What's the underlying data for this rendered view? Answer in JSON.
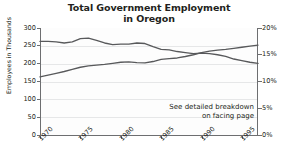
{
  "chart_data": {
    "type": "line",
    "title": "Total Government Employment in Oregon",
    "title_line1": "Total Government Employment",
    "title_line2": "in Oregon",
    "xlabel": "",
    "ylabel": "Employees in Thousands",
    "y2label": "Percentage of Total Employment",
    "ylim": [
      0,
      300
    ],
    "y2lim": [
      0,
      20
    ],
    "xlim": [
      1970,
      1997
    ],
    "grid": true,
    "legend": "none",
    "yticks": [
      "0",
      "50",
      "100",
      "150",
      "200",
      "250",
      "300"
    ],
    "ytick_values": [
      0,
      50,
      100,
      150,
      200,
      250,
      300
    ],
    "y2ticks": [
      "0%",
      "5%",
      "10%",
      "15%",
      "20%"
    ],
    "y2tick_values": [
      0,
      5,
      10,
      15,
      20
    ],
    "xticks": [
      "1970",
      "1975",
      "1980",
      "1985",
      "1990",
      "1995"
    ],
    "xtick_values": [
      1970,
      1975,
      1980,
      1985,
      1990,
      1995
    ],
    "x": [
      1970,
      1971,
      1972,
      1973,
      1974,
      1975,
      1976,
      1977,
      1978,
      1979,
      1980,
      1981,
      1982,
      1983,
      1984,
      1985,
      1986,
      1987,
      1988,
      1989,
      1990,
      1991,
      1992,
      1993,
      1994,
      1995,
      1996,
      1997
    ],
    "series": [
      {
        "name": "Percentage of Total Employment",
        "axis": "right",
        "units": "percent",
        "color": "#58595b",
        "values": [
          17.5,
          17.5,
          17.4,
          17.2,
          17.4,
          18.0,
          18.1,
          17.7,
          17.2,
          16.9,
          17.0,
          17.0,
          17.2,
          17.1,
          16.5,
          16.0,
          15.9,
          15.6,
          15.4,
          15.2,
          15.3,
          15.2,
          15.0,
          14.7,
          14.2,
          13.9,
          13.6,
          13.4
        ]
      },
      {
        "name": "Employees in Thousands",
        "axis": "left",
        "units": "thousands",
        "color": "#58595b",
        "values": [
          163,
          168,
          173,
          178,
          184,
          190,
          194,
          196,
          198,
          201,
          204,
          205,
          203,
          202,
          206,
          212,
          214,
          216,
          220,
          225,
          231,
          235,
          238,
          240,
          243,
          246,
          249,
          252
        ]
      }
    ],
    "annotations": [
      {
        "name": "see-detailed-breakdown",
        "line1": "See detailed breakdown",
        "line2": "on facing page"
      }
    ]
  }
}
